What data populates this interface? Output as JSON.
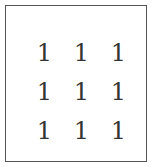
{
  "matrix": {
    "rows": [
      [
        "1",
        "1",
        "1"
      ],
      [
        "1",
        "1",
        "1"
      ],
      [
        "1",
        "1",
        "1"
      ]
    ]
  }
}
